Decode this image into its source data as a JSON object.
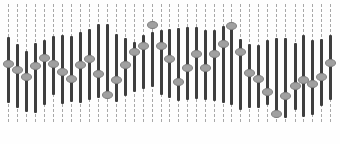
{
  "colors": {
    "background": "#fefefe",
    "rail": "#a8a8a8",
    "bar": "#3e3e3e",
    "knob_fill": "#a0a0a0",
    "knob_border": "#7c7c7c"
  },
  "channels": [
    {
      "x": 9,
      "bar_top": 37,
      "bar_bottom": 103,
      "knob_y": 64
    },
    {
      "x": 18,
      "bar_top": 44,
      "bar_bottom": 108,
      "knob_y": 70
    },
    {
      "x": 27,
      "bar_top": 51,
      "bar_bottom": 112,
      "knob_y": 77
    },
    {
      "x": 36,
      "bar_top": 43,
      "bar_bottom": 113,
      "knob_y": 66
    },
    {
      "x": 45,
      "bar_top": 40,
      "bar_bottom": 105,
      "knob_y": 58
    },
    {
      "x": 54,
      "bar_top": 36,
      "bar_bottom": 95,
      "knob_y": 64
    },
    {
      "x": 63,
      "bar_top": 35,
      "bar_bottom": 104,
      "knob_y": 72
    },
    {
      "x": 72,
      "bar_top": 36,
      "bar_bottom": 102,
      "knob_y": 79
    },
    {
      "x": 81,
      "bar_top": 32,
      "bar_bottom": 103,
      "knob_y": 65
    },
    {
      "x": 90,
      "bar_top": 29,
      "bar_bottom": 100,
      "knob_y": 59
    },
    {
      "x": 99,
      "bar_top": 24,
      "bar_bottom": 98,
      "knob_y": 74
    },
    {
      "x": 108,
      "bar_top": 24,
      "bar_bottom": 95,
      "knob_y": 95
    },
    {
      "x": 117,
      "bar_top": 34,
      "bar_bottom": 102,
      "knob_y": 80
    },
    {
      "x": 126,
      "bar_top": 38,
      "bar_bottom": 96,
      "knob_y": 65
    },
    {
      "x": 135,
      "bar_top": 42,
      "bar_bottom": 92,
      "knob_y": 52
    },
    {
      "x": 144,
      "bar_top": 35,
      "bar_bottom": 89,
      "knob_y": 46
    },
    {
      "x": 153,
      "bar_top": 32,
      "bar_bottom": 87,
      "knob_y": 25
    },
    {
      "x": 162,
      "bar_top": 30,
      "bar_bottom": 95,
      "knob_y": 46
    },
    {
      "x": 170,
      "bar_top": 29,
      "bar_bottom": 98,
      "knob_y": 59
    },
    {
      "x": 179,
      "bar_top": 28,
      "bar_bottom": 101,
      "knob_y": 82
    },
    {
      "x": 188,
      "bar_top": 27,
      "bar_bottom": 100,
      "knob_y": 68
    },
    {
      "x": 197,
      "bar_top": 27,
      "bar_bottom": 99,
      "knob_y": 54
    },
    {
      "x": 206,
      "bar_top": 30,
      "bar_bottom": 100,
      "knob_y": 68
    },
    {
      "x": 215,
      "bar_top": 30,
      "bar_bottom": 101,
      "knob_y": 54
    },
    {
      "x": 224,
      "bar_top": 26,
      "bar_bottom": 103,
      "knob_y": 44
    },
    {
      "x": 232,
      "bar_top": 26,
      "bar_bottom": 105,
      "knob_y": 26
    },
    {
      "x": 241,
      "bar_top": 39,
      "bar_bottom": 110,
      "knob_y": 52
    },
    {
      "x": 250,
      "bar_top": 44,
      "bar_bottom": 108,
      "knob_y": 73
    },
    {
      "x": 259,
      "bar_top": 45,
      "bar_bottom": 108,
      "knob_y": 79
    },
    {
      "x": 268,
      "bar_top": 40,
      "bar_bottom": 105,
      "knob_y": 92
    },
    {
      "x": 277,
      "bar_top": 38,
      "bar_bottom": 115,
      "knob_y": 114
    },
    {
      "x": 286,
      "bar_top": 38,
      "bar_bottom": 118,
      "knob_y": 96
    },
    {
      "x": 296,
      "bar_top": 43,
      "bar_bottom": 110,
      "knob_y": 86
    },
    {
      "x": 304,
      "bar_top": 35,
      "bar_bottom": 117,
      "knob_y": 80
    },
    {
      "x": 313,
      "bar_top": 40,
      "bar_bottom": 115,
      "knob_y": 84
    },
    {
      "x": 322,
      "bar_top": 39,
      "bar_bottom": 106,
      "knob_y": 77
    },
    {
      "x": 331,
      "bar_top": 35,
      "bar_bottom": 100,
      "knob_y": 63
    }
  ]
}
